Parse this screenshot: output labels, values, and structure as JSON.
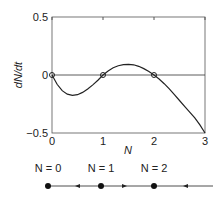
{
  "chart_data": {
    "type": "line",
    "xlabel": "N",
    "ylabel": "dN/dt",
    "xlim": [
      0,
      3
    ],
    "ylim": [
      -0.5,
      0.5
    ],
    "xticks": [
      "0",
      "1",
      "2",
      "3"
    ],
    "yticks": [
      "0.5",
      "0",
      "−0.5"
    ],
    "series": [
      {
        "name": "dN/dt",
        "x": [
          0,
          0.1,
          0.2,
          0.3,
          0.4,
          0.5,
          0.6,
          0.7,
          0.8,
          0.9,
          1.0,
          1.1,
          1.2,
          1.3,
          1.4,
          1.5,
          1.6,
          1.7,
          1.8,
          1.9,
          2.0,
          2.1,
          2.2,
          2.3,
          2.4,
          2.5,
          2.6,
          2.7,
          2.8,
          2.9,
          3.0
        ],
        "y": [
          0,
          -0.08,
          -0.135,
          -0.165,
          -0.175,
          -0.17,
          -0.15,
          -0.12,
          -0.085,
          -0.045,
          0,
          0.035,
          0.062,
          0.08,
          0.09,
          0.092,
          0.088,
          0.075,
          0.055,
          0.03,
          0,
          -0.035,
          -0.075,
          -0.12,
          -0.17,
          -0.22,
          -0.27,
          -0.32,
          -0.37,
          -0.43,
          -0.5
        ]
      }
    ],
    "equilibria": [
      0,
      1,
      2
    ]
  },
  "phase_line": {
    "labels": [
      "N = 0",
      "N = 1",
      "N = 2"
    ],
    "arrows": [
      "left",
      "right",
      "left"
    ]
  }
}
